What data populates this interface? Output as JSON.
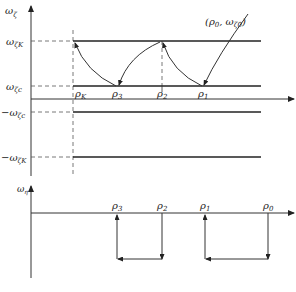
{
  "top_plot": {
    "y_axis_label": "ω",
    "y_axis_sub": "ζ",
    "levels": [
      {
        "name": "omega-zeta-K",
        "label": "ω",
        "sub": "ζK",
        "y": 41
      },
      {
        "name": "omega-zeta-c",
        "label": "ω",
        "sub": "ζc",
        "y": 86
      },
      {
        "name": "neg-omega-zeta-c",
        "label": "−ω",
        "sub": "ζc",
        "y": 112
      },
      {
        "name": "neg-omega-zeta-K",
        "label": "−ω",
        "sub": "ζK",
        "y": 157
      }
    ],
    "rho_labels": [
      {
        "name": "rho-K",
        "base": "ρ",
        "sub": "K",
        "x": 73
      },
      {
        "name": "rho-3",
        "base": "ρ",
        "sub": "3",
        "x": 117
      },
      {
        "name": "rho-2",
        "base": "ρ",
        "sub": "2",
        "x": 162
      },
      {
        "name": "rho-1",
        "base": "ρ",
        "sub": "1",
        "x": 202
      }
    ],
    "start_point_label": "(ρ",
    "start_point_sub0": "0",
    "start_point_mid": ", ω",
    "start_point_sub1": "ζ0",
    "start_point_end": ")"
  },
  "bottom_plot": {
    "y_axis_label": "ω",
    "y_axis_sub": "η",
    "rho_labels": [
      {
        "name": "rho-3",
        "base": "ρ",
        "sub": "3",
        "x": 117
      },
      {
        "name": "rho-2",
        "base": "ρ",
        "sub": "2",
        "x": 162
      },
      {
        "name": "rho-1",
        "base": "ρ",
        "sub": "1",
        "x": 205
      },
      {
        "name": "rho-0",
        "base": "ρ",
        "sub": "0",
        "x": 268
      }
    ]
  },
  "colors": {
    "line": "#333333",
    "thick_line": "#222222",
    "dash": "#555555"
  }
}
